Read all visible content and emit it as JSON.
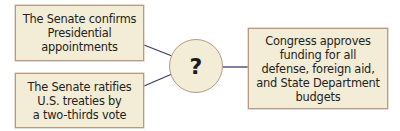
{
  "diagram": {
    "boxes": {
      "top_left": "The Senate confirms\nPresidential\nappointments",
      "bottom_left": "The Senate ratifies\nU.S. treaties by\na two-thirds vote",
      "right": "Congress approves\nfunding for all\ndefense, foreign aid,\nand State Department\nbudgets"
    },
    "center": "?",
    "colors": {
      "box_fill": "#f3ecd6",
      "box_border": "#b59a86",
      "connector": "#3c3c6e",
      "text": "#231f20"
    }
  }
}
